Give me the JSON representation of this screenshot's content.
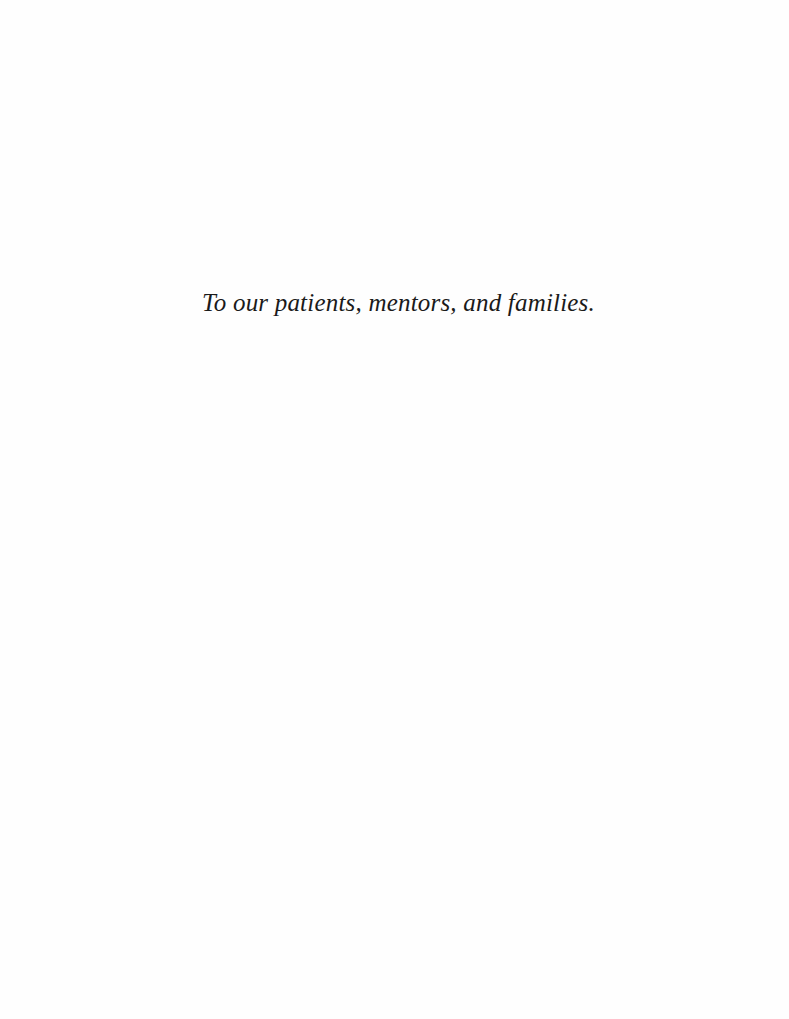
{
  "page": {
    "type": "dedication",
    "background_color": "#fefefe",
    "text_color": "#1a1a1a"
  },
  "dedication": {
    "text": "To our patients, mentors, and families."
  }
}
